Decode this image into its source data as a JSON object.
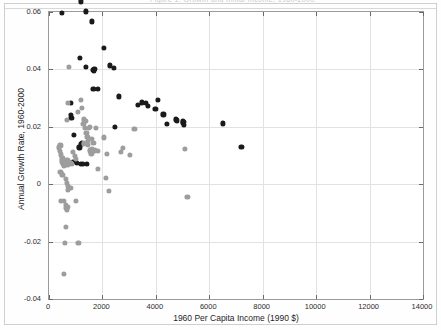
{
  "page": {
    "cut_off_title": "Figure 1. Growth and Initial Income, 1960-2000"
  },
  "chart_data": {
    "type": "scatter",
    "title": "",
    "xlabel": "1960 Per Capita Income (1990 $)",
    "ylabel": "Annual Growth Rate, 1960-2000",
    "xlim": [
      0,
      14000
    ],
    "ylim": [
      -0.04,
      0.06
    ],
    "xticks": [
      0,
      2000,
      4000,
      6000,
      8000,
      10000,
      12000,
      14000
    ],
    "xtick_labels": [
      "0",
      "2000",
      "4000",
      "6000",
      "8000",
      "10000",
      "12000",
      "14000"
    ],
    "yticks": [
      -0.04,
      -0.02,
      0,
      0.02,
      0.04,
      0.06
    ],
    "ytick_labels": [
      "-0.04",
      "-0.02",
      "0",
      "0.02",
      "0.04",
      "0.06"
    ],
    "grid": true,
    "legend": "none",
    "marker_size_px": 5.2,
    "series": [
      {
        "name": "dark-group",
        "color": "#1a1a1a",
        "points": [
          [
            480,
            0.0597
          ],
          [
            1190,
            0.0637
          ],
          [
            1380,
            0.0602
          ],
          [
            1620,
            0.0567
          ],
          [
            1170,
            0.0441
          ],
          [
            2060,
            0.0476
          ],
          [
            1380,
            0.0408
          ],
          [
            1660,
            0.0399
          ],
          [
            1680,
            0.0394
          ],
          [
            1700,
            0.0403
          ],
          [
            2280,
            0.0414
          ],
          [
            2440,
            0.0405
          ],
          [
            1660,
            0.0333
          ],
          [
            1840,
            0.0333
          ],
          [
            2620,
            0.0306
          ],
          [
            3340,
            0.0277
          ],
          [
            3480,
            0.0285
          ],
          [
            3620,
            0.0283
          ],
          [
            3700,
            0.0272
          ],
          [
            3980,
            0.0262
          ],
          [
            4080,
            0.0294
          ],
          [
            4280,
            0.0243
          ],
          [
            4420,
            0.0211
          ],
          [
            4760,
            0.0226
          ],
          [
            4780,
            0.0222
          ],
          [
            5010,
            0.0219
          ],
          [
            5020,
            0.0213
          ],
          [
            5040,
            0.0207
          ],
          [
            5050,
            0.0216
          ],
          [
            6500,
            0.0212
          ],
          [
            7200,
            0.0131
          ],
          [
            2480,
            0.0201
          ],
          [
            830,
            0.0284
          ],
          [
            830,
            0.0241
          ],
          [
            840,
            0.0232
          ],
          [
            920,
            0.0173
          ],
          [
            1140,
            0.0128
          ],
          [
            1210,
            0.0139
          ],
          [
            1240,
            0.0143
          ],
          [
            1180,
            0.0072
          ],
          [
            1430,
            0.0071
          ],
          [
            1270,
            0.0072
          ],
          [
            1040,
            0.0075
          ],
          [
            900,
            0.0078
          ]
        ]
      },
      {
        "name": "light-group",
        "color": "#9d9d9d",
        "points": [
          [
            760,
            0.0408
          ],
          [
            700,
            0.0282
          ],
          [
            680,
            0.0223
          ],
          [
            1070,
            0.0252
          ],
          [
            1180,
            0.0293
          ],
          [
            1300,
            0.0226
          ],
          [
            1380,
            0.0221
          ],
          [
            1400,
            0.0178
          ],
          [
            1440,
            0.0165
          ],
          [
            1450,
            0.0151
          ],
          [
            1520,
            0.0118
          ],
          [
            1560,
            0.0113
          ],
          [
            1590,
            0.0107
          ],
          [
            1610,
            0.0121
          ],
          [
            1240,
            0.0265
          ],
          [
            1290,
            0.0209
          ],
          [
            1350,
            0.0196
          ],
          [
            1460,
            0.0137
          ],
          [
            1320,
            0.0142
          ],
          [
            1490,
            0.0195
          ],
          [
            1530,
            0.0201
          ],
          [
            1610,
            0.0158
          ],
          [
            1660,
            0.0143
          ],
          [
            1700,
            0.0118
          ],
          [
            1770,
            0.0197
          ],
          [
            1820,
            0.0054
          ],
          [
            1840,
            0.0115
          ],
          [
            2060,
            0.0163
          ],
          [
            2120,
            0.0023
          ],
          [
            2180,
            0.0105
          ],
          [
            2250,
            -0.0024
          ],
          [
            2700,
            0.0113
          ],
          [
            2760,
            0.0127
          ],
          [
            3020,
            0.0103
          ],
          [
            3200,
            0.0193
          ],
          [
            5100,
            0.0122
          ],
          [
            5180,
            -0.0044
          ],
          [
            380,
            0.0128
          ],
          [
            420,
            0.0116
          ],
          [
            430,
            0.0135
          ],
          [
            440,
            0.0104
          ],
          [
            470,
            0.0085
          ],
          [
            490,
            0.0077
          ],
          [
            500,
            0.0092
          ],
          [
            520,
            0.0076
          ],
          [
            530,
            0.0085
          ],
          [
            540,
            0.0072
          ],
          [
            560,
            0.0065
          ],
          [
            580,
            0.0081
          ],
          [
            590,
            0.0073
          ],
          [
            600,
            0.0077
          ],
          [
            620,
            0.0069
          ],
          [
            640,
            0.0082
          ],
          [
            660,
            0.0071
          ],
          [
            690,
            0.0083
          ],
          [
            720,
            0.0066
          ],
          [
            760,
            0.0078
          ],
          [
            800,
            0.0073
          ],
          [
            830,
            0.0075
          ],
          [
            860,
            0.0071
          ],
          [
            430,
            0.0042
          ],
          [
            470,
            0.0034
          ],
          [
            520,
            0.0031
          ],
          [
            640,
            0.0018
          ],
          [
            660,
            0.0004
          ],
          [
            700,
            -0.0005
          ],
          [
            720,
            -0.0021
          ],
          [
            800,
            -0.0014
          ],
          [
            440,
            -0.0057
          ],
          [
            560,
            -0.0058
          ],
          [
            620,
            -0.0073
          ],
          [
            640,
            -0.0084
          ],
          [
            680,
            -0.0088
          ],
          [
            700,
            -0.0079
          ],
          [
            1020,
            -0.0059
          ],
          [
            620,
            -0.0149
          ],
          [
            600,
            -0.0204
          ],
          [
            1100,
            -0.0205
          ],
          [
            560,
            -0.0312
          ],
          [
            900,
            0.0112
          ],
          [
            960,
            0.0098
          ],
          [
            1000,
            0.0089
          ]
        ]
      }
    ]
  }
}
